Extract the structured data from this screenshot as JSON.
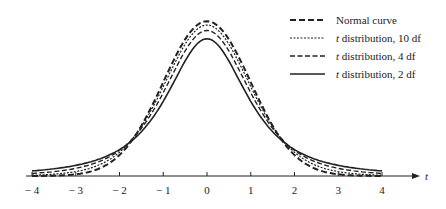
{
  "chart_data": {
    "type": "line",
    "title": "",
    "xlabel": "t",
    "ylabel": "",
    "xlim": [
      -4,
      4
    ],
    "x_ticks": [
      -4,
      -3,
      -2,
      -1,
      0,
      1,
      2,
      3,
      4
    ],
    "x_tick_labels": [
      "− 4",
      "− 3",
      "− 2",
      "− 1",
      "0",
      "1",
      "2",
      "3",
      "4"
    ],
    "grid": false,
    "legend_position": "upper right",
    "series": [
      {
        "name": "Normal curve",
        "style": "dashed-bold",
        "df": null,
        "peak": 0.399
      },
      {
        "name": "t distribution, 10 df",
        "style": "dotted",
        "df": 10,
        "peak": 0.389
      },
      {
        "name": "t distribution, 4 df",
        "style": "dashed",
        "df": 4,
        "peak": 0.375
      },
      {
        "name": "t distribution, 2 df",
        "style": "solid",
        "df": 2,
        "peak": 0.354
      }
    ]
  },
  "legend": {
    "items": [
      {
        "prefix": "",
        "label": "Normal curve"
      },
      {
        "prefix": "t",
        "label": " distribution, 10 df"
      },
      {
        "prefix": "t",
        "label": " distribution,  4 df"
      },
      {
        "prefix": "t",
        "label": " distribution,  2 df"
      }
    ]
  },
  "axis": {
    "label": "t"
  }
}
